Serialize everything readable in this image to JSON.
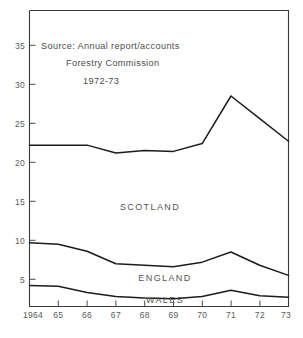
{
  "chart_data": {
    "type": "line",
    "title": "",
    "subtitle": "",
    "xlabel": "",
    "ylabel": "",
    "x": [
      1964,
      1965,
      1966,
      1967,
      1968,
      1969,
      1970,
      1971,
      1972,
      1973
    ],
    "categories": [
      "1964",
      "65",
      "66",
      "67",
      "68",
      "69",
      "70",
      "71",
      "72",
      "73"
    ],
    "xlim": [
      1964,
      1973
    ],
    "ylim": [
      0,
      37.5
    ],
    "yticks": [
      5,
      10,
      15,
      20,
      25,
      30,
      35
    ],
    "ytick_labels": [
      "5",
      "10",
      "15",
      "20",
      "25",
      "30",
      "35"
    ],
    "xtick_labels": [
      "1964",
      "65",
      "66",
      "67",
      "68",
      "69",
      "70",
      "71",
      "72",
      "73"
    ],
    "grid": false,
    "legend_position": "inline-labels",
    "series": [
      {
        "name": "SCOTLAND",
        "values": [
          22.2,
          22.2,
          22.2,
          21.2,
          21.5,
          21.4,
          22.4,
          28.5,
          25.6,
          22.7
        ],
        "color": "#1c1c1c"
      },
      {
        "name": "ENGLAND",
        "values": [
          9.7,
          9.5,
          8.6,
          7.0,
          6.8,
          6.6,
          7.2,
          8.5,
          6.8,
          5.5
        ],
        "color": "#1c1c1c"
      },
      {
        "name": "WALES",
        "values": [
          4.2,
          4.1,
          3.3,
          2.8,
          2.6,
          2.5,
          2.8,
          3.6,
          2.9,
          2.7
        ],
        "color": "#1c1c1c"
      }
    ],
    "annotations": [
      {
        "id": "source-line-1",
        "text": "Source: Annual report/accounts"
      },
      {
        "id": "source-line-2",
        "text": "Forestry Commission"
      },
      {
        "id": "source-line-3",
        "text": "1972-73"
      }
    ],
    "inline_labels": [
      {
        "id": "scotland-label",
        "text": "SCOTLAND"
      },
      {
        "id": "england-label",
        "text": "ENGLAND"
      },
      {
        "id": "wales-label",
        "text": "WALES"
      }
    ]
  },
  "colors": {
    "line": "#1c1c1c",
    "axis": "#3a3a3a",
    "tick_text": "#5a5a5a",
    "annotation_text": "#4d4d4d",
    "background": "#ffffff"
  }
}
